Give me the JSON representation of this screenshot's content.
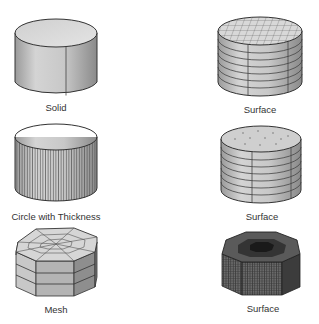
{
  "figures": [
    {
      "id": "solid",
      "label": "Solid"
    },
    {
      "id": "surface-grid",
      "label": "Surface"
    },
    {
      "id": "circle-thickness",
      "label": "Circle with Thickness"
    },
    {
      "id": "surface-open",
      "label": "Surface"
    },
    {
      "id": "mesh",
      "label": "Mesh"
    },
    {
      "id": "surface-dense",
      "label": "Surface"
    }
  ],
  "colors": {
    "outline": "#333333",
    "fill_light": "#d8d8d8",
    "fill_mid": "#b8b8b8",
    "fill_dark": "#555555"
  }
}
